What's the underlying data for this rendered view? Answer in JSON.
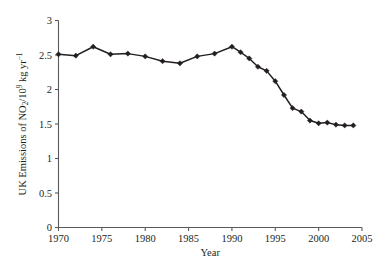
{
  "chart_data": {
    "type": "line",
    "title": "",
    "xlabel": "Year",
    "ylabel": "UK Emissions of NO2/10^9 kg yr^-1",
    "ylabel_parts": {
      "prefix": "UK Emissions of NO",
      "sub": "2",
      "mid": "/10",
      "sup": "9",
      "suffix": " kg yr",
      "sup2": "−1"
    },
    "xlim": [
      1970,
      2005
    ],
    "ylim": [
      0,
      3
    ],
    "xticks": [
      1970,
      1975,
      1980,
      1985,
      1990,
      1995,
      2000,
      2005
    ],
    "xtick_labels": [
      "1970",
      "1975",
      "1980",
      "1985",
      "1990",
      "1995",
      "2000",
      "2005"
    ],
    "yticks": [
      0,
      0.5,
      1,
      1.5,
      2,
      2.5,
      3
    ],
    "ytick_labels": [
      "0",
      "0.5",
      "1",
      "1.5",
      "2",
      "2.5",
      "3"
    ],
    "grid": false,
    "legend": "none",
    "marker": "diamond",
    "line_color": "#231f20",
    "marker_color": "#231f20",
    "axis_color": "#58595b",
    "x": [
      1970,
      1972,
      1974,
      1976,
      1978,
      1980,
      1982,
      1984,
      1986,
      1988,
      1990,
      1991,
      1992,
      1993,
      1994,
      1995,
      1996,
      1997,
      1998,
      1999,
      2000,
      2001,
      2002,
      2003,
      2004
    ],
    "values": [
      2.51,
      2.49,
      2.62,
      2.51,
      2.52,
      2.48,
      2.41,
      2.38,
      2.48,
      2.52,
      2.62,
      2.54,
      2.45,
      2.33,
      2.27,
      2.12,
      1.92,
      1.73,
      1.68,
      1.55,
      1.51,
      1.52,
      1.49,
      1.48,
      1.48
    ],
    "series": [
      {
        "name": "UK NO2 emissions",
        "values": [
          2.51,
          2.49,
          2.62,
          2.51,
          2.52,
          2.48,
          2.41,
          2.38,
          2.48,
          2.52,
          2.62,
          2.54,
          2.45,
          2.33,
          2.27,
          2.12,
          1.92,
          1.73,
          1.68,
          1.55,
          1.51,
          1.52,
          1.49,
          1.48,
          1.48
        ]
      }
    ]
  }
}
